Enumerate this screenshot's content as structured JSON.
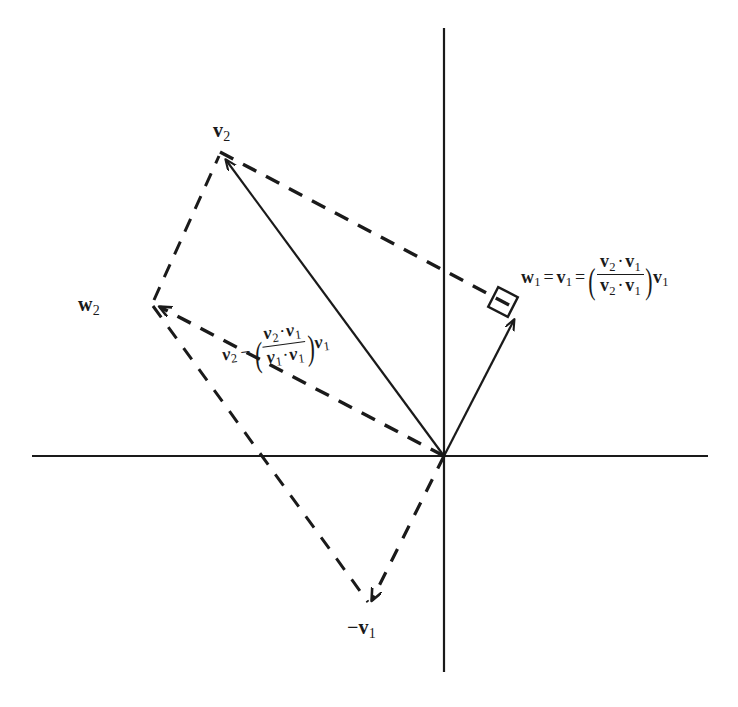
{
  "figure": {
    "background_color": "#ffffff",
    "stroke_color": "#1a1a1a",
    "width": 738,
    "height": 707
  },
  "axes": {
    "horizontal": {
      "x1": 32,
      "y1": 456,
      "x2": 708,
      "y2": 456
    },
    "vertical": {
      "x1": 444,
      "y1": 28,
      "x2": 444,
      "y2": 672
    },
    "origin": {
      "x": 444,
      "y": 456
    }
  },
  "vectors": {
    "v1": {
      "label": "v",
      "subscript": "1",
      "style": "solid",
      "from": {
        "x": 444,
        "y": 456
      },
      "to": {
        "x": 518,
        "y": 312
      }
    },
    "v2": {
      "label": "v",
      "subscript": "2",
      "style": "solid",
      "from": {
        "x": 444,
        "y": 456
      },
      "to": {
        "x": 220,
        "y": 152
      },
      "label_position": {
        "x": 213,
        "y": 120
      }
    },
    "w2": {
      "label": "w",
      "subscript": "2",
      "style": "dashed",
      "from": {
        "x": 444,
        "y": 456
      },
      "to": {
        "x": 152,
        "y": 303
      },
      "label_position": {
        "x": 78,
        "y": 294
      }
    },
    "neg_v1": {
      "label": "−v",
      "subscript": "1",
      "style": "dashed",
      "from": {
        "x": 444,
        "y": 456
      },
      "to": {
        "x": 370,
        "y": 607
      },
      "label_position": {
        "x": 347,
        "y": 617
      }
    }
  },
  "dashed_construction_lines": [
    {
      "name": "v2-to-w1",
      "from": {
        "x": 220,
        "y": 152
      },
      "to": {
        "x": 513,
        "y": 307
      }
    },
    {
      "name": "w2-to-v2",
      "from": {
        "x": 152,
        "y": 303
      },
      "to": {
        "x": 220,
        "y": 152
      }
    },
    {
      "name": "w2-to-negv1",
      "from": {
        "x": 152,
        "y": 303
      },
      "to": {
        "x": 370,
        "y": 607
      }
    }
  ],
  "right_angle_marker": {
    "name": "right-angle-at-w1",
    "center": {
      "x": 503,
      "y": 302
    },
    "size": 22,
    "rotation_deg": 27
  },
  "labels": {
    "v2": {
      "base": "v",
      "sub": "2"
    },
    "w2": {
      "base": "w",
      "sub": "2"
    },
    "neg_v1": {
      "base": "−v",
      "sub": "1"
    },
    "w1_formula": {
      "lhs_base": "w",
      "lhs_sub": "1",
      "eq1": "=",
      "mid_base": "v",
      "mid_sub": "1",
      "eq2": "=",
      "paren_open": "(",
      "num_a_base": "v",
      "num_a_sub": "2",
      "dot": "·",
      "num_b_base": "v",
      "num_b_sub": "1",
      "den_a_base": "v",
      "den_a_sub": "2",
      "den_b_base": "v",
      "den_b_sub": "1",
      "paren_close": ")",
      "tail_base": "v",
      "tail_sub": "1"
    },
    "projection_formula": {
      "lead_base": "v",
      "lead_sub": "2",
      "minus": "−",
      "paren_open": "(",
      "num_a_base": "v",
      "num_a_sub": "2",
      "dot": "·",
      "num_b_base": "v",
      "num_b_sub": "1",
      "den_a_base": "v",
      "den_a_sub": "1",
      "den_b_base": "v",
      "den_b_sub": "1",
      "paren_close": ")",
      "tail_base": "v",
      "tail_sub": "1"
    }
  }
}
